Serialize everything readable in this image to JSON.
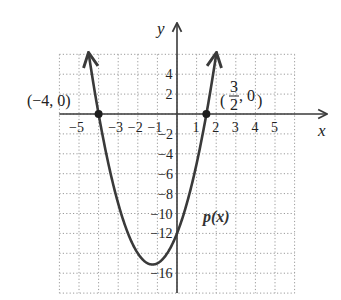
{
  "chart_data": {
    "type": "line",
    "title": "",
    "xlabel": "x",
    "ylabel": "y",
    "function_label": "p(x)",
    "function": "p(x) = 2x^2 + 5x - 12",
    "xlim": [
      -6,
      6
    ],
    "ylim": [
      -18,
      6
    ],
    "grid": true,
    "grid_style": "dotted",
    "x_ticks": [
      -5,
      -3,
      -2,
      -1,
      1,
      2,
      3,
      4,
      5
    ],
    "x_tick_labels": [
      "−5",
      "−3",
      "−2",
      "−1",
      "1",
      "2",
      "3",
      "4",
      "5"
    ],
    "y_ticks": [
      4,
      2,
      -2,
      -4,
      -6,
      -8,
      -10,
      -12,
      -16
    ],
    "y_tick_labels": [
      "4",
      "2",
      "−2",
      "−4",
      "−6",
      "−8",
      "−10",
      "−12",
      "−16"
    ],
    "series": [
      {
        "name": "p(x)",
        "x": [
          -4.5,
          -4,
          -3,
          -2,
          -1.25,
          -1,
          0,
          1,
          1.5,
          2
        ],
        "y": [
          6,
          0,
          -9,
          -14,
          -15.125,
          -15,
          -12,
          -5,
          0,
          6
        ]
      }
    ],
    "points": [
      {
        "x": -4,
        "y": 0,
        "label": "(−4, 0)"
      },
      {
        "x": 1.5,
        "y": 0,
        "label_num": "3",
        "label_den": "2",
        "label_rest": ", 0"
      }
    ],
    "color": "#3a3a3a"
  }
}
